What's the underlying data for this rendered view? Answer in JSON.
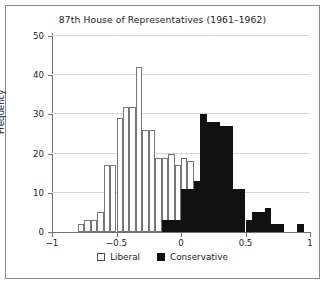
{
  "chart_data": {
    "type": "bar",
    "title": "87th House of Representatives (1961–1962)",
    "xlabel": "",
    "ylabel": "Frequency",
    "xlim": [
      -1,
      1
    ],
    "ylim": [
      0,
      50
    ],
    "bin_width": 0.05,
    "grid": true,
    "legend_position": "bottom-center",
    "xticks": [
      -1,
      -0.5,
      0,
      0.5,
      1
    ],
    "xtick_labels": [
      "−1",
      "−0.5",
      "0",
      "0.5",
      "1"
    ],
    "yticks": [
      0,
      10,
      20,
      30,
      40,
      50
    ],
    "ytick_labels": [
      "0",
      "10",
      "20",
      "30",
      "40",
      "50"
    ],
    "series": [
      {
        "name": "Liberal",
        "color": "#ffffff",
        "edge_color": "#767676",
        "bins": [
          {
            "x0": -0.8,
            "x1": -0.75,
            "value": 2
          },
          {
            "x0": -0.75,
            "x1": -0.7,
            "value": 3
          },
          {
            "x0": -0.7,
            "x1": -0.65,
            "value": 3
          },
          {
            "x0": -0.65,
            "x1": -0.6,
            "value": 5
          },
          {
            "x0": -0.6,
            "x1": -0.55,
            "value": 17
          },
          {
            "x0": -0.55,
            "x1": -0.5,
            "value": 17
          },
          {
            "x0": -0.5,
            "x1": -0.45,
            "value": 29
          },
          {
            "x0": -0.45,
            "x1": -0.4,
            "value": 32
          },
          {
            "x0": -0.4,
            "x1": -0.35,
            "value": 32
          },
          {
            "x0": -0.35,
            "x1": -0.3,
            "value": 42
          },
          {
            "x0": -0.3,
            "x1": -0.25,
            "value": 26
          },
          {
            "x0": -0.25,
            "x1": -0.2,
            "value": 26
          },
          {
            "x0": -0.2,
            "x1": -0.15,
            "value": 19
          },
          {
            "x0": -0.15,
            "x1": -0.1,
            "value": 19
          },
          {
            "x0": -0.1,
            "x1": -0.05,
            "value": 20
          },
          {
            "x0": -0.05,
            "x1": 0.0,
            "value": 17
          },
          {
            "x0": 0.0,
            "x1": 0.05,
            "value": 19
          },
          {
            "x0": 0.05,
            "x1": 0.1,
            "value": 18
          },
          {
            "x0": 0.1,
            "x1": 0.15,
            "value": 13
          },
          {
            "x0": 0.15,
            "x1": 0.2,
            "value": 10
          },
          {
            "x0": 0.2,
            "x1": 0.25,
            "value": 8
          },
          {
            "x0": 0.25,
            "x1": 0.3,
            "value": 3
          }
        ]
      },
      {
        "name": "Conservative",
        "color": "#111111",
        "edge_color": "#111111",
        "bins": [
          {
            "x0": -0.15,
            "x1": -0.1,
            "value": 3
          },
          {
            "x0": -0.1,
            "x1": -0.05,
            "value": 3
          },
          {
            "x0": -0.05,
            "x1": 0.0,
            "value": 3
          },
          {
            "x0": 0.0,
            "x1": 0.05,
            "value": 11
          },
          {
            "x0": 0.05,
            "x1": 0.1,
            "value": 11
          },
          {
            "x0": 0.1,
            "x1": 0.15,
            "value": 13
          },
          {
            "x0": 0.15,
            "x1": 0.2,
            "value": 30
          },
          {
            "x0": 0.2,
            "x1": 0.25,
            "value": 28
          },
          {
            "x0": 0.25,
            "x1": 0.3,
            "value": 28
          },
          {
            "x0": 0.3,
            "x1": 0.35,
            "value": 27
          },
          {
            "x0": 0.35,
            "x1": 0.4,
            "value": 27
          },
          {
            "x0": 0.4,
            "x1": 0.45,
            "value": 11
          },
          {
            "x0": 0.45,
            "x1": 0.5,
            "value": 11
          },
          {
            "x0": 0.5,
            "x1": 0.55,
            "value": 3
          },
          {
            "x0": 0.55,
            "x1": 0.6,
            "value": 5
          },
          {
            "x0": 0.6,
            "x1": 0.65,
            "value": 5
          },
          {
            "x0": 0.65,
            "x1": 0.7,
            "value": 6
          },
          {
            "x0": 0.7,
            "x1": 0.75,
            "value": 2
          },
          {
            "x0": 0.75,
            "x1": 0.8,
            "value": 2
          },
          {
            "x0": 0.9,
            "x1": 0.95,
            "value": 2
          }
        ]
      }
    ],
    "legend": [
      {
        "label": "Liberal",
        "swatch": "open"
      },
      {
        "label": "Conservative",
        "swatch": "filled"
      }
    ]
  }
}
